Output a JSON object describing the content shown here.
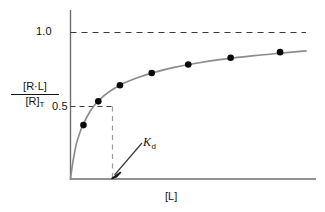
{
  "chart_data": {
    "type": "scatter",
    "title": "",
    "subtitle": "",
    "xlabel": "[L]",
    "ylabel_numerator": "[R·L]",
    "ylabel_denominator": "[R]",
    "ylabel_denominator_subscript": "T",
    "grid": false,
    "legend": "none",
    "xlim": [
      0,
      1
    ],
    "ylim": [
      0,
      1.12
    ],
    "y_ticks": [
      {
        "value": 0.5,
        "label": "0.5"
      },
      {
        "value": 1.0,
        "label": "1.0"
      }
    ],
    "x_ticks": [],
    "series": [
      {
        "name": "binding curve",
        "kind": "line",
        "color": "#8c8c8c",
        "description": "hyperbolic saturation binding curve through origin approaching 1.0",
        "x": [
          0.0,
          0.01,
          0.025,
          0.045,
          0.07,
          0.1,
          0.14,
          0.18,
          0.23,
          0.29,
          0.36,
          0.44,
          0.54,
          0.65,
          0.78,
          0.9,
          1.0
        ],
        "y": [
          0.0,
          0.115,
          0.24,
          0.34,
          0.425,
          0.5,
          0.565,
          0.612,
          0.657,
          0.695,
          0.73,
          0.762,
          0.792,
          0.818,
          0.842,
          0.86,
          0.874
        ]
      },
      {
        "name": "measured points",
        "kind": "markers",
        "color": "#0a0a0a",
        "x": [
          0.055,
          0.118,
          0.21,
          0.345,
          0.5,
          0.68,
          0.89
        ],
        "y": [
          0.368,
          0.53,
          0.64,
          0.724,
          0.782,
          0.828,
          0.866
        ]
      }
    ],
    "annotations": [
      {
        "name": "saturation-line",
        "kind": "horizontal-dashed",
        "y": 1.0,
        "x_start": 0.0,
        "x_end": 1.02,
        "color": "#3a3a3a"
      },
      {
        "name": "half-saturation-line",
        "kind": "horizontal-dashed",
        "y": 0.5,
        "x_start": 0.0,
        "x_end": 0.1,
        "color": "#3a3a3a"
      },
      {
        "name": "kd-drop-line",
        "kind": "vertical-dashed",
        "x": 0.1,
        "y_start": 0.0,
        "y_end": 0.5,
        "color": "#8c8c8c"
      },
      {
        "name": "kd-arrow",
        "kind": "arrow",
        "label": "K",
        "label_subscript": "d",
        "points_to_x": 0.1,
        "points_to_y": 0.0,
        "color": "#3a3a3a"
      }
    ]
  },
  "axes": {
    "y_axis_name": "y-axis-line",
    "x_axis_name": "x-axis-line",
    "axis_color": "#6e6e6e"
  },
  "labels": {
    "y_tick_1": "1.0",
    "y_tick_05": "0.5",
    "y_axis_numerator": "[R·L]",
    "y_axis_denominator": "[R]",
    "y_axis_denominator_sub": "T",
    "x_axis": "[L]",
    "kd_main": "K",
    "kd_sub": "d"
  }
}
